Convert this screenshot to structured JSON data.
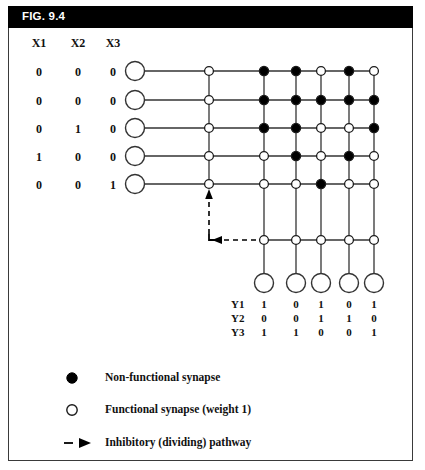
{
  "figure": {
    "title": "FIG. 9.4",
    "header_bg": "#000000",
    "header_fg": "#ffffff",
    "border_color": "#3a3a3a",
    "ink_color": "#111111"
  },
  "input_table": {
    "headers": [
      "X1",
      "X2",
      "X3"
    ],
    "rows": [
      [
        "0",
        "0",
        "0"
      ],
      [
        "0",
        "0",
        "0"
      ],
      [
        "0",
        "1",
        "0"
      ],
      [
        "1",
        "0",
        "0"
      ],
      [
        "0",
        "0",
        "1"
      ]
    ]
  },
  "output_table": {
    "row_labels": [
      "Y1",
      "Y2",
      "Y3"
    ],
    "rows": [
      [
        "1",
        "0",
        "1",
        "0",
        "1"
      ],
      [
        "0",
        "0",
        "1",
        "1",
        "0"
      ],
      [
        "1",
        "1",
        "0",
        "0",
        "1"
      ]
    ]
  },
  "synapse_grid": {
    "legend_filled": "filled = non-functional synapse",
    "legend_open": "open = functional synapse (weight 1)",
    "columns": 6,
    "rows": 5,
    "states": [
      [
        "open",
        "filled",
        "filled",
        "open",
        "filled",
        "open"
      ],
      [
        "open",
        "filled",
        "filled",
        "filled",
        "filled",
        "filled"
      ],
      [
        "open",
        "filled",
        "filled",
        "open",
        "open",
        "filled"
      ],
      [
        "open",
        "open",
        "filled",
        "open",
        "filled",
        "open"
      ],
      [
        "open",
        "open",
        "open",
        "filled",
        "open",
        "open"
      ]
    ],
    "inhibitory_row_states": [
      "open",
      "open",
      "open",
      "open",
      "open"
    ]
  },
  "legend": {
    "items": [
      {
        "marker": "filled-circle",
        "label": "Non-functional synapse"
      },
      {
        "marker": "open-circle",
        "label": "Functional synapse (weight 1)"
      },
      {
        "marker": "dashed-arrow",
        "label": "Inhibitory (dividing) pathway"
      }
    ]
  }
}
